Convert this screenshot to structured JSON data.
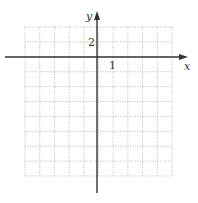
{
  "figure": {
    "type": "coordinate-grid",
    "x_axis_label": "x",
    "y_axis_label": "y",
    "x_tick_label": "1",
    "y_tick_label": "2",
    "x_units_per_grid": 1,
    "y_units_per_grid": 2,
    "grid": {
      "columns": 10,
      "rows": 10,
      "columns_left_of_y_axis": 5,
      "rows_above_x_axis": 2,
      "line_style": "dotted",
      "line_color": "#bbbbbb"
    },
    "axis_color": "#333333"
  }
}
